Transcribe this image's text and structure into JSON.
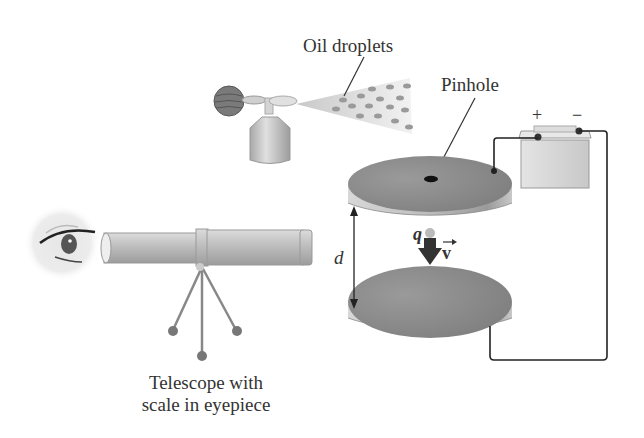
{
  "diagram": {
    "labels": {
      "oil_droplets": "Oil droplets",
      "pinhole": "Pinhole",
      "battery_plus": "+",
      "battery_minus": "−",
      "charge": "q",
      "velocity": "v",
      "separation": "d",
      "telescope_line1": "Telescope with",
      "telescope_line2": "scale in eyepiece"
    },
    "colors": {
      "plate_top": "#8a8a8a",
      "plate_side": "#c4c4c4",
      "wire": "#222222",
      "spray": "#d8d8d8",
      "droplet": "#9a9a9a",
      "telescope": "#bdbdbd",
      "text": "#333333"
    }
  }
}
